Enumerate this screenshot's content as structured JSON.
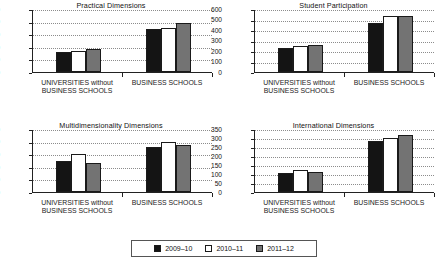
{
  "figure": {
    "series_colors": [
      "#141414",
      "#ffffff",
      "#737373"
    ],
    "categories": [
      "UNIVERSITIES without BUSINESS SCHOOLS",
      "BUSINESS SCHOOLS"
    ],
    "category_lines": [
      [
        "UNIVERSITIES without",
        "BUSINESS SCHOOLS"
      ],
      [
        "BUSINESS SCHOOLS"
      ]
    ]
  },
  "legend": {
    "position": "bottom-center",
    "items": [
      {
        "label": "2009–10",
        "color": "#141414",
        "name": "legend-swatch-2009-10"
      },
      {
        "label": "2010–11",
        "color": "#ffffff",
        "name": "legend-swatch-2010-11"
      },
      {
        "label": "2011–12",
        "color": "#737373",
        "name": "legend-swatch-2011-12"
      }
    ]
  },
  "chart_data": [
    {
      "type": "bar",
      "title": "Practical Dimensions",
      "xlabel": "",
      "ylabel": "",
      "categories": [
        "UNIVERSITIES without BUSINESS SCHOOLS",
        "BUSINESS SCHOOLS"
      ],
      "series": [
        {
          "name": "2009–10",
          "values": [
            155,
            345
          ]
        },
        {
          "name": "2010–11",
          "values": [
            170,
            352
          ]
        },
        {
          "name": "2011–12",
          "values": [
            183,
            392
          ]
        }
      ],
      "ylim": [
        0,
        500
      ],
      "yticks": [
        0,
        100,
        200,
        300,
        400,
        500
      ],
      "grid": true
    },
    {
      "type": "bar",
      "title": "Student Participation",
      "xlabel": "",
      "ylabel": "",
      "categories": [
        "UNIVERSITIES without BUSINESS SCHOOLS",
        "BUSINESS SCHOOLS"
      ],
      "series": [
        {
          "name": "2009–10",
          "values": [
            228,
            463
          ]
        },
        {
          "name": "2010–11",
          "values": [
            252,
            531
          ]
        },
        {
          "name": "2011–12",
          "values": [
            257,
            536
          ]
        }
      ],
      "ylim": [
        0,
        600
      ],
      "yticks": [
        0,
        100,
        200,
        300,
        400,
        500,
        600
      ],
      "grid": true
    },
    {
      "type": "bar",
      "title": "Multidimensionality Dimensions",
      "xlabel": "",
      "ylabel": "",
      "categories": [
        "UNIVERSITIES without BUSINESS SCHOOLS",
        "BUSINESS SCHOOLS"
      ],
      "series": [
        {
          "name": "2009–10",
          "values": [
            122,
            178
          ]
        },
        {
          "name": "2010–11",
          "values": [
            149,
            197
          ]
        },
        {
          "name": "2011–12",
          "values": [
            115,
            188
          ]
        }
      ],
      "ylim": [
        0,
        250
      ],
      "yticks": [
        0,
        50,
        100,
        150,
        200,
        250
      ],
      "grid": true
    },
    {
      "type": "bar",
      "title": "International Dimensions",
      "xlabel": "",
      "ylabel": "",
      "categories": [
        "UNIVERSITIES without BUSINESS SCHOOLS",
        "BUSINESS SCHOOLS"
      ],
      "series": [
        {
          "name": "2009–10",
          "values": [
            108,
            281
          ]
        },
        {
          "name": "2010–11",
          "values": [
            120,
            301
          ]
        },
        {
          "name": "2011–12",
          "values": [
            110,
            317
          ]
        }
      ],
      "ylim": [
        0,
        350
      ],
      "yticks": [
        0,
        50,
        100,
        150,
        200,
        250,
        300,
        350
      ],
      "grid": true
    }
  ]
}
